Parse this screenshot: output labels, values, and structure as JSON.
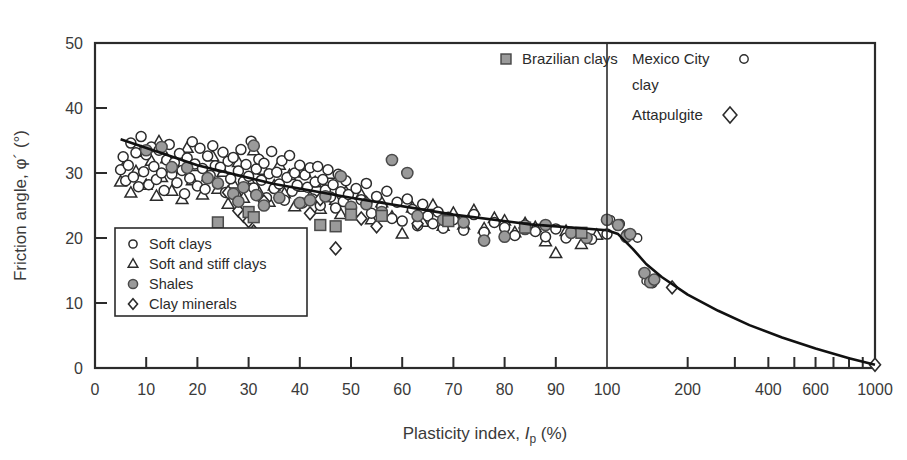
{
  "chart_data": {
    "type": "scatter",
    "title": "",
    "xlabel_parts": {
      "main": "Plasticity index, ",
      "italic": "I",
      "sub": "p",
      "unit": " (%)"
    },
    "xlabel": "Plasticity index, Ip (%)",
    "ylabel_parts": {
      "main": "Friction angle, ",
      "symbol": "φ´",
      "unit": " (°)"
    },
    "ylabel": "Friction angle, φ´ (°)",
    "x_scale": "linear-then-log",
    "x_linear_range": [
      0,
      100
    ],
    "x_log_range": [
      100,
      1000
    ],
    "xticks_linear": [
      "0",
      "10",
      "20",
      "30",
      "40",
      "50",
      "60",
      "70",
      "80",
      "90",
      "100"
    ],
    "xticks_log": [
      "200",
      "400",
      "600",
      "1000"
    ],
    "xtick_log_values": [
      200,
      300,
      400,
      500,
      600,
      700,
      800,
      900,
      1000
    ],
    "yticks": [
      "0",
      "10",
      "20",
      "30",
      "40",
      "50"
    ],
    "ylim": [
      0,
      50
    ],
    "grid": false,
    "divider_x": 100,
    "legend_position": "lower-left-inset",
    "legend_entries": [
      {
        "marker": "open-circle",
        "label": "Soft clays"
      },
      {
        "marker": "open-triangle",
        "label": "Soft and stiff clays"
      },
      {
        "marker": "filled-circle",
        "label": "Shales"
      },
      {
        "marker": "open-diamond",
        "label": "Clay minerals"
      }
    ],
    "annotations": [
      {
        "marker": "filled-square",
        "label": "Brazilian clays",
        "x": 519,
        "y": 64
      },
      {
        "marker": "open-circle",
        "label": "Mexico City",
        "label2": "clay",
        "x": 632,
        "y": 64
      },
      {
        "marker": "open-diamond",
        "label": "Attapulgite",
        "x": 632,
        "y": 120
      }
    ],
    "trend_line_linear": [
      [
        5,
        35.2
      ],
      [
        20,
        31.2
      ],
      [
        35,
        28.3
      ],
      [
        50,
        26.2
      ],
      [
        70,
        23.6
      ],
      [
        85,
        22.1
      ],
      [
        100,
        21.2
      ]
    ],
    "trend_line_log": [
      [
        100,
        21.2
      ],
      [
        110,
        20.6
      ],
      [
        125,
        18.3
      ],
      [
        140,
        16.0
      ],
      [
        160,
        14.0
      ],
      [
        200,
        11.3
      ],
      [
        260,
        8.8
      ],
      [
        340,
        6.6
      ],
      [
        450,
        4.7
      ],
      [
        600,
        3.0
      ],
      [
        800,
        1.5
      ],
      [
        1000,
        0.5
      ]
    ],
    "series": [
      {
        "name": "Soft clays",
        "marker": "open-circle",
        "points": [
          [
            5,
            30.5
          ],
          [
            5.5,
            32.5
          ],
          [
            6,
            28.8
          ],
          [
            6.5,
            31.2
          ],
          [
            7,
            34.6
          ],
          [
            7.5,
            29.4
          ],
          [
            8,
            33.1
          ],
          [
            8.5,
            27.9
          ],
          [
            9,
            35.6
          ],
          [
            9.5,
            30.2
          ],
          [
            10,
            32.8
          ],
          [
            10.5,
            28.2
          ],
          [
            11,
            34.0
          ],
          [
            11.5,
            31.0
          ],
          [
            12,
            29.0
          ],
          [
            12.5,
            33.5
          ],
          [
            13,
            30.0
          ],
          [
            13.5,
            27.3
          ],
          [
            14,
            32.0
          ],
          [
            14.5,
            34.4
          ],
          [
            15,
            29.8
          ],
          [
            15.5,
            31.6
          ],
          [
            16,
            28.5
          ],
          [
            16.5,
            33.0
          ],
          [
            17,
            30.4
          ],
          [
            17.5,
            26.8
          ],
          [
            18,
            32.3
          ],
          [
            18.5,
            29.2
          ],
          [
            19,
            34.8
          ],
          [
            19.5,
            31.4
          ],
          [
            20,
            28.0
          ],
          [
            20.5,
            33.8
          ],
          [
            21,
            30.7
          ],
          [
            21.5,
            27.5
          ],
          [
            22,
            32.6
          ],
          [
            22.5,
            29.6
          ],
          [
            23,
            34.2
          ],
          [
            23.5,
            31.1
          ],
          [
            24,
            28.4
          ],
          [
            24.5,
            30.9
          ],
          [
            25,
            33.2
          ],
          [
            25.5,
            27.0
          ],
          [
            26,
            31.8
          ],
          [
            26.5,
            29.1
          ],
          [
            27,
            32.4
          ],
          [
            27.5,
            26.5
          ],
          [
            28,
            30.3
          ],
          [
            28.5,
            33.6
          ],
          [
            29,
            28.7
          ],
          [
            29.5,
            31.3
          ],
          [
            30,
            29.5
          ],
          [
            30.5,
            34.9
          ],
          [
            31,
            27.7
          ],
          [
            31.5,
            30.6
          ],
          [
            32,
            32.1
          ],
          [
            32.5,
            28.9
          ],
          [
            33,
            31.5
          ],
          [
            33.5,
            26.2
          ],
          [
            34,
            29.9
          ],
          [
            34.5,
            33.3
          ],
          [
            35,
            27.6
          ],
          [
            35.5,
            30.1
          ],
          [
            36,
            28.3
          ],
          [
            36.5,
            31.9
          ],
          [
            37,
            25.8
          ],
          [
            37.5,
            29.3
          ],
          [
            38,
            32.7
          ],
          [
            38.5,
            27.2
          ],
          [
            39,
            30.0
          ],
          [
            39.5,
            28.1
          ],
          [
            40,
            31.2
          ],
          [
            40.5,
            25.4
          ],
          [
            41,
            29.7
          ],
          [
            41.5,
            27.8
          ],
          [
            42,
            30.8
          ],
          [
            42.5,
            26.0
          ],
          [
            43,
            28.6
          ],
          [
            43.5,
            31.0
          ],
          [
            44,
            25.0
          ],
          [
            44.5,
            29.0
          ],
          [
            45,
            27.4
          ],
          [
            45.5,
            30.5
          ],
          [
            46,
            26.3
          ],
          [
            46.5,
            28.2
          ],
          [
            47,
            24.6
          ],
          [
            47.5,
            29.8
          ],
          [
            48,
            27.1
          ],
          [
            48.5,
            25.6
          ],
          [
            49,
            28.8
          ],
          [
            49.5,
            26.7
          ],
          [
            50,
            24.2
          ],
          [
            51,
            27.6
          ],
          [
            52,
            25.9
          ],
          [
            53,
            28.4
          ],
          [
            54,
            23.8
          ],
          [
            55,
            26.4
          ],
          [
            56,
            24.8
          ],
          [
            57,
            27.2
          ],
          [
            58,
            23.0
          ],
          [
            59,
            25.5
          ],
          [
            60,
            22.6
          ],
          [
            61,
            26.0
          ],
          [
            62,
            24.4
          ],
          [
            63,
            21.9
          ],
          [
            64,
            25.2
          ],
          [
            65,
            23.4
          ],
          [
            66,
            22.2
          ],
          [
            67,
            24.0
          ],
          [
            68,
            21.5
          ],
          [
            69,
            23.2
          ],
          [
            70,
            22.8
          ],
          [
            72,
            21.2
          ],
          [
            74,
            23.6
          ],
          [
            76,
            20.9
          ],
          [
            78,
            22.4
          ],
          [
            80,
            21.6
          ],
          [
            82,
            20.4
          ],
          [
            84,
            22.0
          ],
          [
            86,
            21.0
          ],
          [
            88,
            20.2
          ],
          [
            90,
            21.4
          ],
          [
            92,
            20.0
          ],
          [
            95,
            20.8
          ],
          [
            97,
            19.8
          ],
          [
            100,
            20.6
          ]
        ]
      },
      {
        "name": "Soft and stiff clays",
        "marker": "open-triangle",
        "points": [
          [
            5,
            28.6
          ],
          [
            6,
            31.4
          ],
          [
            7,
            26.9
          ],
          [
            8,
            30.2
          ],
          [
            9,
            33.2
          ],
          [
            10,
            28.1
          ],
          [
            11,
            31.8
          ],
          [
            12,
            26.4
          ],
          [
            12.5,
            34.8
          ],
          [
            13,
            29.3
          ],
          [
            14,
            32.2
          ],
          [
            15,
            27.2
          ],
          [
            16,
            30.6
          ],
          [
            17,
            25.9
          ],
          [
            18,
            33.8
          ],
          [
            19,
            28.8
          ],
          [
            20,
            31.0
          ],
          [
            21,
            26.6
          ],
          [
            22,
            29.4
          ],
          [
            23,
            32.5
          ],
          [
            24,
            27.5
          ],
          [
            25,
            30.1
          ],
          [
            26,
            25.2
          ],
          [
            27,
            28.3
          ],
          [
            28,
            31.6
          ],
          [
            29,
            26.1
          ],
          [
            30,
            29.0
          ],
          [
            31,
            33.4
          ],
          [
            32,
            27.0
          ],
          [
            33,
            30.4
          ],
          [
            34,
            25.5
          ],
          [
            35,
            28.0
          ],
          [
            36,
            31.2
          ],
          [
            37,
            26.8
          ],
          [
            38,
            29.6
          ],
          [
            39,
            24.8
          ],
          [
            40,
            27.8
          ],
          [
            41,
            30.0
          ],
          [
            42,
            26.2
          ],
          [
            43,
            28.5
          ],
          [
            44,
            24.4
          ],
          [
            45,
            27.3
          ],
          [
            46,
            29.8
          ],
          [
            47,
            25.8
          ],
          [
            48,
            23.6
          ],
          [
            49,
            27.0
          ],
          [
            50,
            24.0
          ],
          [
            52,
            26.6
          ],
          [
            54,
            22.8
          ],
          [
            56,
            25.4
          ],
          [
            58,
            23.2
          ],
          [
            60,
            20.6
          ],
          [
            62,
            24.6
          ],
          [
            64,
            22.4
          ],
          [
            66,
            25.0
          ],
          [
            68,
            21.8
          ],
          [
            70,
            23.8
          ],
          [
            72,
            22.0
          ],
          [
            74,
            24.2
          ],
          [
            76,
            21.4
          ],
          [
            78,
            23.0
          ],
          [
            80,
            22.6
          ],
          [
            82,
            20.8
          ],
          [
            84,
            22.2
          ],
          [
            86,
            21.6
          ],
          [
            88,
            19.4
          ],
          [
            90,
            17.6
          ],
          [
            92,
            21.0
          ],
          [
            95,
            19.0
          ],
          [
            98,
            20.4
          ]
        ]
      },
      {
        "name": "Shales",
        "marker": "filled-circle",
        "points": [
          [
            10,
            33.5
          ],
          [
            13,
            34.0
          ],
          [
            15,
            30.9
          ],
          [
            18,
            30.8
          ],
          [
            22,
            29.2
          ],
          [
            24,
            28.4
          ],
          [
            27,
            26.8
          ],
          [
            28,
            25.6
          ],
          [
            29,
            27.8
          ],
          [
            31,
            34.2
          ],
          [
            31.5,
            26.6
          ],
          [
            33,
            25.0
          ],
          [
            36,
            26.2
          ],
          [
            40,
            25.4
          ],
          [
            42,
            25.8
          ],
          [
            45,
            26.4
          ],
          [
            48,
            29.5
          ],
          [
            50,
            24.8
          ],
          [
            53,
            25.2
          ],
          [
            56,
            24.0
          ],
          [
            58,
            32.0
          ],
          [
            61,
            30.0
          ],
          [
            63,
            23.4
          ],
          [
            68,
            22.8
          ],
          [
            72,
            22.4
          ],
          [
            76,
            19.6
          ],
          [
            80,
            20.2
          ],
          [
            84,
            21.4
          ],
          [
            88,
            22.0
          ],
          [
            93,
            20.8
          ],
          [
            96,
            20.0
          ],
          [
            100,
            22.8
          ],
          [
            110,
            22.0
          ],
          [
            118,
            20.2
          ],
          [
            122,
            20.6
          ],
          [
            138,
            14.6
          ],
          [
            145,
            13.2
          ],
          [
            150,
            13.6
          ]
        ]
      },
      {
        "name": "Clay minerals",
        "marker": "open-diamond",
        "points": [
          [
            26,
            27.0
          ],
          [
            28,
            24.2
          ],
          [
            29,
            23.4
          ],
          [
            30,
            22.6
          ],
          [
            31,
            21.0
          ],
          [
            33,
            25.6
          ],
          [
            42,
            23.8
          ],
          [
            44,
            26.0
          ],
          [
            47,
            18.4
          ],
          [
            50,
            24.6
          ],
          [
            52,
            23.0
          ],
          [
            53,
            25.4
          ],
          [
            55,
            21.8
          ],
          [
            63,
            22.2
          ],
          [
            175,
            12.4
          ],
          [
            1000,
            0.5
          ]
        ]
      },
      {
        "name": "Brazilian clays",
        "marker": "filled-square",
        "points": [
          [
            24,
            22.4
          ],
          [
            30,
            24.0
          ],
          [
            31,
            23.2
          ],
          [
            44,
            22.0
          ],
          [
            47,
            21.8
          ],
          [
            50,
            23.6
          ],
          [
            56,
            23.4
          ],
          [
            69,
            22.6
          ],
          [
            84,
            21.6
          ],
          [
            95,
            20.8
          ]
        ]
      },
      {
        "name": "Mexico City clay",
        "marker": "open-circle-small",
        "points": [
          [
            103,
            22.8
          ],
          [
            112,
            22.2
          ],
          [
            118,
            20.6
          ],
          [
            124,
            20.4
          ],
          [
            130,
            20.0
          ],
          [
            140,
            13.4
          ],
          [
            148,
            13.0
          ]
        ]
      }
    ]
  }
}
